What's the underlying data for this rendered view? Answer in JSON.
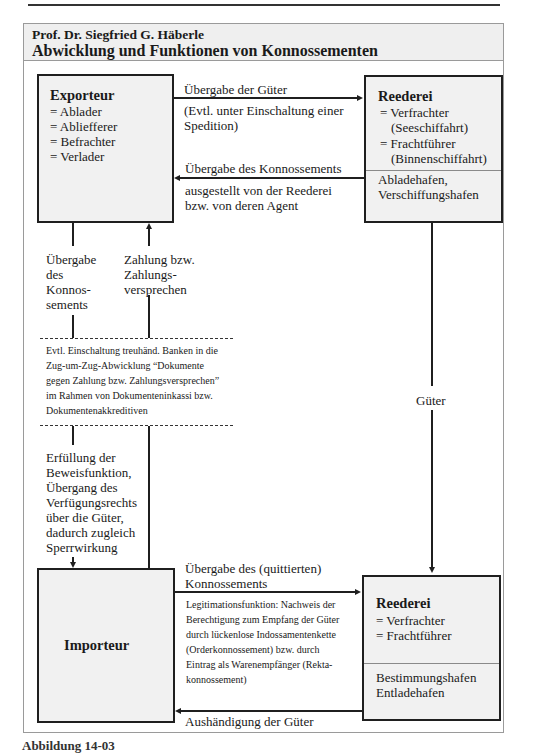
{
  "header": {
    "author": "Prof. Dr. Siegfried G. Häberle",
    "title": "Abwicklung und Funktionen von Konnossementen"
  },
  "exporteur": {
    "title": "Exporteur",
    "roles": [
      "= Ablader",
      "= Abliefferer",
      "= Befrachter",
      "= Verlader"
    ]
  },
  "reederei_top": {
    "title": "Reederei",
    "roles": [
      "= Verfrachter",
      "(Seeschiffahrt)",
      "= Frachtführer",
      "(Binnenschiffahrt)"
    ],
    "ports": [
      "Abladehafen,",
      "Verschiffungshafen"
    ]
  },
  "flows_top": {
    "goods_handover": "Übergabe der Güter",
    "goods_handover_note": [
      "(Evtl. unter Einschaltung einer",
      "Spedition)"
    ],
    "bl_handover": "Übergabe des Konnossements",
    "bl_handover_note": [
      "ausgestellt von der Reederei",
      "bzw. von deren Agent"
    ]
  },
  "flows_left": {
    "bl_to_bank": [
      "Übergabe",
      "des",
      "Konnos-",
      "sements"
    ],
    "payment": [
      "Zahlung bzw.",
      "Zahlungs-",
      "versprechen"
    ]
  },
  "bank_note": [
    "Evtl. Einschaltung treuhänd. Banken in die",
    "Zug-um-Zug-Abwicklung “Dokumente",
    "gegen Zahlung bzw. Zahlungsversprechen”",
    "im Rahmen von Dokumenteninkassi bzw.",
    "Dokumentenakkreditiven"
  ],
  "function_note": [
    "Erfüllung der",
    "Beweisfunktion,",
    "Übergang des",
    "Verfügungsrechts",
    "über die Güter,",
    "dadurch zugleich",
    "Sperrwirkung"
  ],
  "goods_vertical": "Güter",
  "importeur": {
    "title": "Importeur"
  },
  "flows_bottom": {
    "bl_handover": [
      "Übergabe des (quittierten)",
      "Konnossements"
    ],
    "legitimation": [
      "Legitimationsfunktion: Nachweis der",
      "Berechtigung zum Empfang der Güter",
      "durch lückenlose Indossamentenkette",
      "(Orderkonnossement) bzw. durch",
      "Eintrag als Warenempfänger (Rekta-",
      "konnossement)"
    ],
    "goods_delivery": "Aushändigung der Güter"
  },
  "reederei_bottom": {
    "title": "Reederei",
    "roles": [
      "= Verfrachter",
      "= Frachtführer"
    ],
    "ports": [
      "Bestimmungshafen",
      "Entladehafen"
    ]
  },
  "caption": "Abbildung 14-03"
}
